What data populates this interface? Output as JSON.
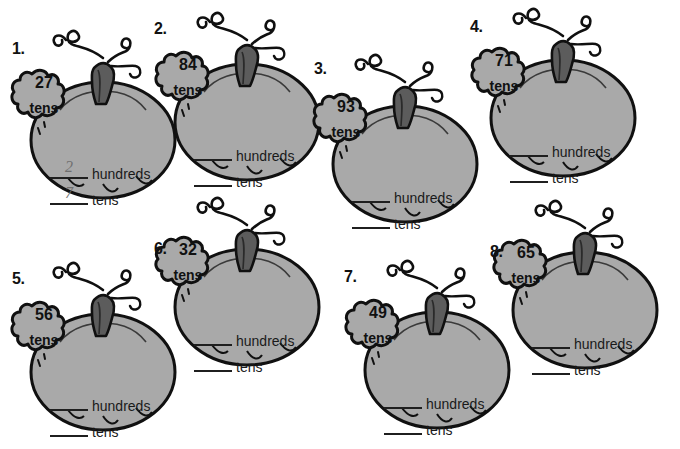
{
  "worksheet": {
    "title": "Pumpkin Place Value Worksheet",
    "colors": {
      "pumpkin_body": "#a9a9a9",
      "pumpkin_outline": "#101010",
      "stem_dark": "#4f4f4f",
      "stem_light": "#6e6e6e",
      "page_background": "#ffffff",
      "answer_ink": "#6f6f6f"
    },
    "labels": {
      "hundreds": "hundreds",
      "tens": "tens",
      "leaf_unit": "tens"
    },
    "items": [
      {
        "number": "1.",
        "leaf_value": "84",
        "leaf_unit": "tens",
        "hundreds_answer": "2",
        "tens_answer": "7",
        "hundreds_label": "hundreds",
        "tens_label": "tens"
      },
      {
        "number": "2.",
        "leaf_value": "84",
        "leaf_unit": "tens",
        "hundreds_answer": "",
        "tens_answer": "",
        "hundreds_label": "hundreds",
        "tens_label": "tens"
      },
      {
        "number": "3.",
        "leaf_value": "93",
        "leaf_unit": "tens",
        "hundreds_answer": "",
        "tens_answer": "",
        "hundreds_label": "hundreds",
        "tens_label": "tens"
      },
      {
        "number": "4.",
        "leaf_value": "71",
        "leaf_unit": "tens",
        "hundreds_answer": "",
        "tens_answer": "",
        "hundreds_label": "hundreds",
        "tens_label": "tens"
      },
      {
        "number": "5.",
        "leaf_value": "56",
        "leaf_unit": "tens",
        "hundreds_answer": "",
        "tens_answer": "",
        "hundreds_label": "hundreds",
        "tens_label": "tens"
      },
      {
        "number": "6.",
        "leaf_value": "32",
        "leaf_unit": "tens",
        "hundreds_answer": "",
        "tens_answer": "",
        "hundreds_label": "hundreds",
        "tens_label": "tens"
      },
      {
        "number": "7.",
        "leaf_value": "49",
        "leaf_unit": "tens",
        "hundreds_answer": "",
        "tens_answer": "",
        "hundreds_label": "hundreds",
        "tens_label": "tens"
      },
      {
        "number": "8.",
        "leaf_value": "65",
        "leaf_unit": "tens",
        "hundreds_answer": "",
        "tens_answer": "",
        "hundreds_label": "hundreds",
        "tens_label": "tens"
      }
    ],
    "item_1_leaf_value": "27"
  }
}
